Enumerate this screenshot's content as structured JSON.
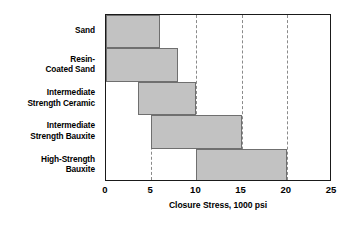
{
  "chart_data": {
    "type": "bar",
    "orientation": "horizontal",
    "title": "",
    "xlabel": "Closure Stress, 1000 psi",
    "ylabel": "",
    "xlim": [
      0,
      25
    ],
    "xticks": [
      0,
      5,
      10,
      15,
      20,
      25
    ],
    "xtick_labels": [
      "0",
      "5",
      "10",
      "15",
      "20",
      "25"
    ],
    "grid": "vertical-dashed",
    "legend": "none",
    "categories": [
      "Sand",
      "Resin-\nCoated Sand",
      "Intermediate\nStrength Ceramic",
      "Intermediate\nStrength Bauxite",
      "High-Strength\nBauxite"
    ],
    "bars": [
      {
        "label": "Sand",
        "start": 0,
        "end": 6
      },
      {
        "label": "Resin-Coated Sand",
        "start": 0,
        "end": 8
      },
      {
        "label": "Intermediate Strength Ceramic",
        "start": 3.5,
        "end": 10
      },
      {
        "label": "Intermediate Strength Bauxite",
        "start": 5,
        "end": 15
      },
      {
        "label": "High-Strength Bauxite",
        "start": 10,
        "end": 20
      }
    ],
    "colors": {
      "bar_fill": "#c2c2c2",
      "bar_border": "#6f6f6f",
      "axis": "#1a1a1a",
      "gridline": "#8a8a8a",
      "text": "#000000",
      "background": "#ffffff"
    }
  }
}
